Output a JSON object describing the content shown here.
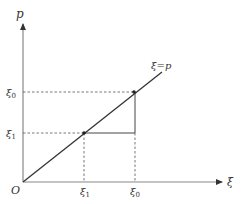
{
  "diagram": {
    "axes": {
      "y_label": "p",
      "x_label": "ξ",
      "origin_label": "O"
    },
    "line_label": {
      "main": "ξ",
      "eq": "=",
      "rhs": "p"
    },
    "y_ticks": [
      {
        "base": "ξ",
        "sub": "0"
      },
      {
        "base": "ξ",
        "sub": "1"
      }
    ],
    "x_ticks": [
      {
        "base": "ξ",
        "sub": "1"
      },
      {
        "base": "ξ",
        "sub": "0"
      }
    ],
    "points": [
      {
        "name": "xi0",
        "x": "ξ0",
        "y": "ξ0"
      },
      {
        "name": "xi1",
        "x": "ξ1",
        "y": "ξ1"
      }
    ],
    "colors": {
      "axis": "#888888",
      "line": "#333333",
      "dash": "#555555"
    }
  }
}
